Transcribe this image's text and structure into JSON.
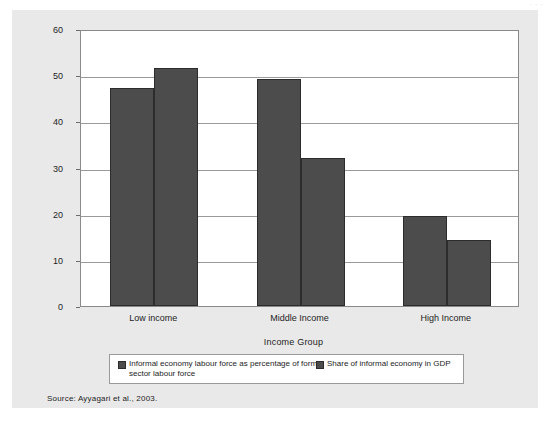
{
  "figure": {
    "top_bleed_text": "· · ·",
    "source_note": "Source: Ayyagari et al., 2003."
  },
  "colors": {
    "panel_background": "#e9e9e9",
    "plot_background": "#ffffff",
    "bar_fill": "#4c4c4c",
    "bar_border": "#2c2c2c",
    "gridline": "#9a9a9a",
    "text": "#1d1d1d"
  },
  "legend": {
    "position": "bottom",
    "entries": [
      {
        "label": "Informal economy labour force as percentage of formal sector labour force",
        "color": "#4c4c4c"
      },
      {
        "label": "Share of informal economy in GDP",
        "color": "#4c4c4c"
      }
    ]
  },
  "chart_data": {
    "type": "bar",
    "title": "",
    "xlabel": "Income Group",
    "ylabel": "Percentage",
    "categories": [
      "Low income",
      "Middle Income",
      "High Income"
    ],
    "series": [
      {
        "name": "Informal economy labour force as percentage of formal sector labour force",
        "values": [
          47.2,
          49.1,
          19.4
        ]
      },
      {
        "name": "Share of informal economy in GDP",
        "values": [
          51.6,
          32.1,
          14.4
        ]
      }
    ],
    "ylim": [
      0,
      60
    ],
    "yticks": [
      0,
      10,
      20,
      30,
      40,
      50,
      60
    ],
    "ytick_labels": [
      "0",
      "10",
      "20",
      "30",
      "40",
      "50",
      "60"
    ],
    "grid": true,
    "grid_axis": "y"
  }
}
